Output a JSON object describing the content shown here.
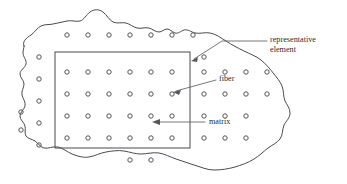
{
  "figure": {
    "background_color": "#ffffff",
    "outline_color": "#4a4a52",
    "fiber_color": "#55555c",
    "text_color": "#2b2b30",
    "width": 347,
    "height": 184
  },
  "labels": {
    "representative_element_line1": "representative",
    "representative_element_line2": "element",
    "fiber": "fiber",
    "matrix": "matrix"
  },
  "diagram_data": {
    "type": "diagram",
    "subject": "fiber-reinforced composite microstructure",
    "regions": [
      {
        "name": "matrix-blob",
        "description": "irregular wavy outline enclosing the full composite cross-section"
      },
      {
        "name": "representative-element",
        "description": "rectangular sub-region used as the representative volume element",
        "rect": {
          "x": 55,
          "y": 52,
          "width": 135,
          "height": 96
        }
      }
    ],
    "fiber_grid": {
      "description": "regular square array of circular fiber cross-sections",
      "spacing_x": 21,
      "spacing_y": 22,
      "radius": 2.2,
      "columns_inside_element": 6,
      "rows_inside_element": 4
    },
    "callouts": [
      {
        "label": "representative element",
        "target": "rectangle right edge"
      },
      {
        "label": "fiber",
        "target": "single circle inside rectangle"
      },
      {
        "label": "matrix",
        "target": "region between fibers"
      }
    ]
  }
}
